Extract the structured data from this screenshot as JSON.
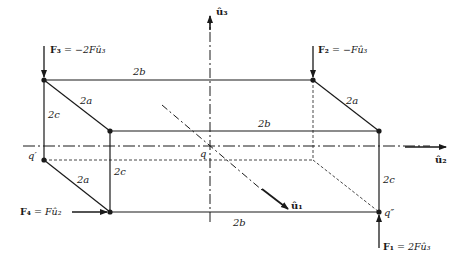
{
  "figure": {
    "axes": {
      "u1": "û₁",
      "u2": "û₂",
      "u3": "û₃"
    },
    "forces": {
      "F1": {
        "name": "F₁",
        "expr": "= 2Fû₃"
      },
      "F2": {
        "name": "F₂",
        "expr": "= −Fû₃"
      },
      "F3": {
        "name": "F₃",
        "expr": "= −2Fû₃"
      },
      "F4": {
        "name": "F₄",
        "expr": "= Fû₂"
      }
    },
    "dimensions": {
      "top_back_b": "2b",
      "top_front_b": "2b",
      "bottom_front_b": "2b",
      "left_top_a": "2a",
      "right_top_a": "2a",
      "left_bottom_a": "2a",
      "left_back_c": "2c",
      "left_front_c": "2c",
      "right_front_c": "2c"
    },
    "points": {
      "q": "q",
      "q_prime": "q′",
      "q_double_prime": "q″"
    },
    "colors": {
      "ink": "#1a1a1a",
      "background": "#ffffff"
    }
  }
}
